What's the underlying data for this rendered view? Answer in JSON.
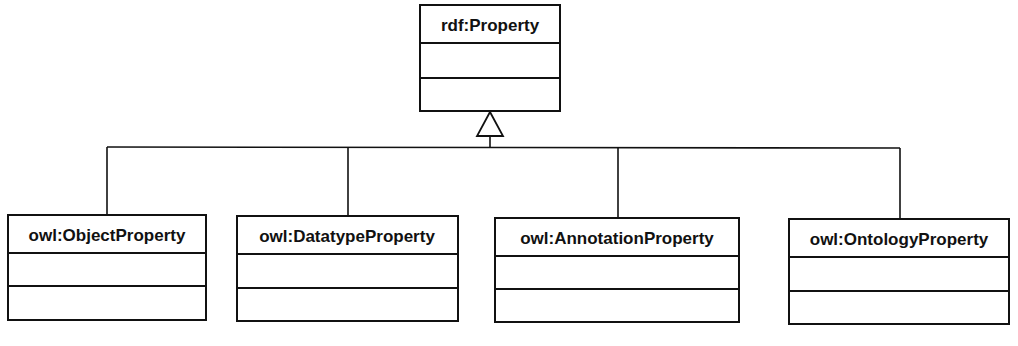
{
  "diagram": {
    "type": "uml-class-generalization",
    "parent": {
      "name": "rdf:Property",
      "attributes": [],
      "operations": []
    },
    "children": [
      {
        "name": "owl:ObjectProperty",
        "attributes": [],
        "operations": []
      },
      {
        "name": "owl:DatatypeProperty",
        "attributes": [],
        "operations": []
      },
      {
        "name": "owl:AnnotationProperty",
        "attributes": [],
        "operations": []
      },
      {
        "name": "owl:OntologyProperty",
        "attributes": [],
        "operations": []
      }
    ],
    "relationship": "generalization",
    "colors": {
      "stroke": "#111111",
      "fill": "#ffffff",
      "background": "#ffffff"
    }
  }
}
